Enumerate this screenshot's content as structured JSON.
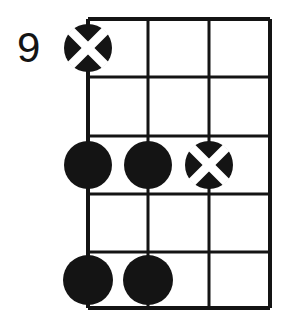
{
  "diagram": {
    "fret_label": "9",
    "label_position": "left",
    "instrument": "guitar",
    "strings_shown": 4,
    "frets_shown": 5,
    "colors": {
      "ink": "#141414",
      "background": "#ffffff",
      "cross": "#ffffff"
    },
    "grid": {
      "left": 88,
      "right": 270,
      "top": 19,
      "bottom": 308,
      "string_x": [
        88,
        148,
        209,
        270
      ],
      "fret_y": [
        19,
        77,
        136,
        194,
        252,
        308
      ],
      "line_width_outer": 4,
      "line_width_inner": 3
    },
    "markers": [
      {
        "name": "marker-x-string1-fret1",
        "type": "x-circle",
        "string_index": 0,
        "fret_index": 1,
        "cx": 88,
        "cy": 48,
        "r": 24,
        "label": "X"
      },
      {
        "name": "marker-dot-string1-fret3",
        "type": "filled-dot",
        "string_index": 0,
        "fret_index": 3,
        "cx": 88,
        "cy": 165,
        "r": 24,
        "label": ""
      },
      {
        "name": "marker-dot-string2-fret3",
        "type": "filled-dot",
        "string_index": 1,
        "fret_index": 3,
        "cx": 148,
        "cy": 165,
        "r": 24,
        "label": ""
      },
      {
        "name": "marker-x-string3-fret3",
        "type": "x-circle",
        "string_index": 2,
        "fret_index": 3,
        "cx": 209,
        "cy": 165,
        "r": 24,
        "label": "X"
      },
      {
        "name": "marker-dot-string1-fret5",
        "type": "filled-dot",
        "string_index": 0,
        "fret_index": 5,
        "cx": 88,
        "cy": 280,
        "r": 25,
        "label": ""
      },
      {
        "name": "marker-dot-string2-fret5",
        "type": "filled-dot",
        "string_index": 1,
        "fret_index": 5,
        "cx": 148,
        "cy": 280,
        "r": 25,
        "label": ""
      }
    ]
  }
}
